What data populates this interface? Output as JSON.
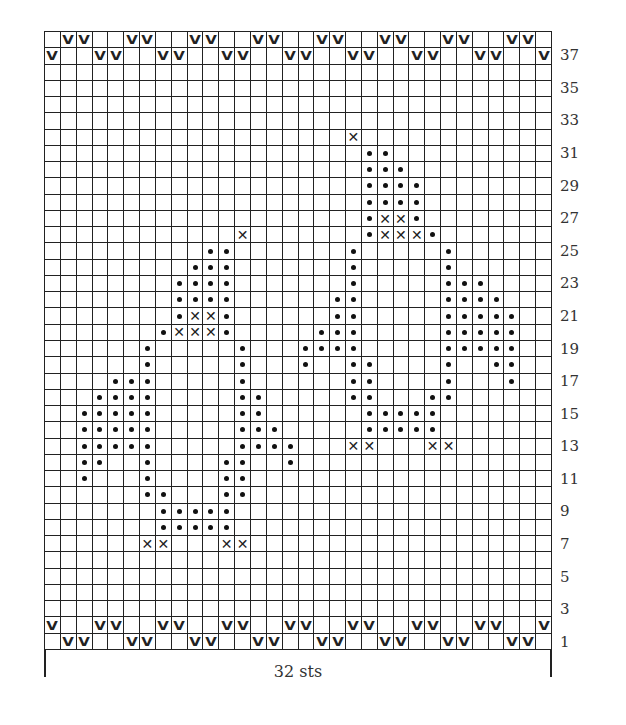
{
  "chart_data": {
    "type": "table",
    "title": "",
    "columns": 32,
    "rows": 38,
    "row_numbering": "bottom-to-top, numbers on right at odd rows",
    "row_labels": [
      "1",
      "3",
      "5",
      "7",
      "9",
      "11",
      "13",
      "15",
      "17",
      "19",
      "21",
      "23",
      "25",
      "27",
      "29",
      "31",
      "33",
      "35",
      "37"
    ],
    "width_label": "32 sts",
    "legend_symbols": {
      "V": "v-stitch",
      "dot": "dot-stitch",
      "X": "x-stitch"
    },
    "marks": {
      "38": {
        "V": [
          2,
          3,
          6,
          7,
          10,
          11,
          14,
          15,
          18,
          19,
          22,
          23,
          26,
          27,
          30,
          31
        ]
      },
      "37": {
        "V": [
          1,
          4,
          5,
          8,
          9,
          12,
          13,
          16,
          17,
          20,
          21,
          24,
          25,
          28,
          29,
          32
        ]
      },
      "32": {
        "X": [
          20
        ]
      },
      "31": {
        "dot": [
          21,
          22
        ]
      },
      "30": {
        "dot": [
          21,
          22,
          23
        ]
      },
      "29": {
        "dot": [
          21,
          22,
          23,
          24
        ]
      },
      "28": {
        "dot": [
          21,
          22,
          23,
          24
        ]
      },
      "27": {
        "dot": [
          21,
          24
        ],
        "X": [
          22,
          23
        ]
      },
      "26": {
        "dot": [
          21,
          25
        ],
        "X": [
          13,
          22,
          23,
          24
        ]
      },
      "25": {
        "dot": [
          11,
          12,
          20,
          26
        ]
      },
      "24": {
        "dot": [
          10,
          11,
          12,
          20,
          26
        ]
      },
      "23": {
        "dot": [
          9,
          10,
          11,
          12,
          20,
          26,
          27,
          28
        ]
      },
      "22": {
        "dot": [
          9,
          10,
          11,
          12,
          19,
          20,
          26,
          27,
          28,
          29
        ]
      },
      "21": {
        "dot": [
          9,
          12,
          19,
          20,
          26,
          27,
          28,
          29,
          30
        ],
        "X": [
          10,
          11
        ]
      },
      "20": {
        "dot": [
          8,
          12,
          18,
          19,
          20,
          26,
          27,
          28,
          29,
          30
        ],
        "X": [
          9,
          10,
          11
        ]
      },
      "19": {
        "dot": [
          7,
          13,
          17,
          18,
          19,
          20,
          26,
          27,
          28,
          29,
          30
        ]
      },
      "18": {
        "dot": [
          7,
          13,
          17,
          20,
          21,
          26,
          29,
          30
        ]
      },
      "17": {
        "dot": [
          5,
          6,
          7,
          13,
          20,
          21,
          26,
          30
        ]
      },
      "16": {
        "dot": [
          4,
          5,
          6,
          7,
          13,
          14,
          20,
          21,
          25,
          26
        ]
      },
      "15": {
        "dot": [
          3,
          4,
          5,
          6,
          7,
          13,
          14,
          21,
          22,
          23,
          24,
          25
        ]
      },
      "14": {
        "dot": [
          3,
          4,
          5,
          6,
          7,
          13,
          14,
          15,
          21,
          22,
          23,
          24,
          25
        ]
      },
      "13": {
        "dot": [
          3,
          4,
          5,
          6,
          7,
          13,
          14,
          15,
          16
        ],
        "X": [
          20,
          21,
          25,
          26
        ]
      },
      "12": {
        "dot": [
          3,
          4,
          7,
          12,
          13,
          16
        ]
      },
      "11": {
        "dot": [
          3,
          7,
          12,
          13
        ]
      },
      "10": {
        "dot": [
          7,
          8,
          12,
          13
        ]
      },
      "9": {
        "dot": [
          8,
          9,
          10,
          11,
          12
        ]
      },
      "8": {
        "dot": [
          8,
          9,
          10,
          11,
          12
        ]
      },
      "7": {
        "X": [
          7,
          8,
          12,
          13
        ]
      },
      "2": {
        "V": [
          1,
          4,
          5,
          8,
          9,
          12,
          13,
          16,
          17,
          20,
          21,
          24,
          25,
          28,
          29,
          32
        ]
      },
      "1": {
        "V": [
          2,
          3,
          6,
          7,
          10,
          11,
          14,
          15,
          18,
          19,
          22,
          23,
          26,
          27,
          30,
          31
        ]
      }
    }
  },
  "symbols": {
    "V": "V",
    "X": "✕"
  },
  "labels": {
    "width": "32 sts"
  }
}
